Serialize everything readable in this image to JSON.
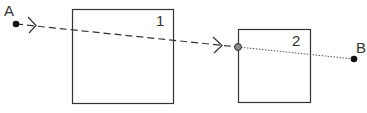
{
  "diagram": {
    "points": [
      {
        "id": "A",
        "label": "A"
      },
      {
        "id": "B",
        "label": "B"
      }
    ],
    "boxes": [
      {
        "id": "box-1",
        "label": "1"
      },
      {
        "id": "box-2",
        "label": "2"
      }
    ],
    "segments": [
      {
        "from": "A",
        "to": "box-2-entry",
        "style": "dashed",
        "arrows": 2
      },
      {
        "from": "box-2-entry",
        "to": "B",
        "style": "dotted"
      }
    ],
    "colors": {
      "stroke": "#333333",
      "entry_point_fill": "#888888"
    }
  }
}
